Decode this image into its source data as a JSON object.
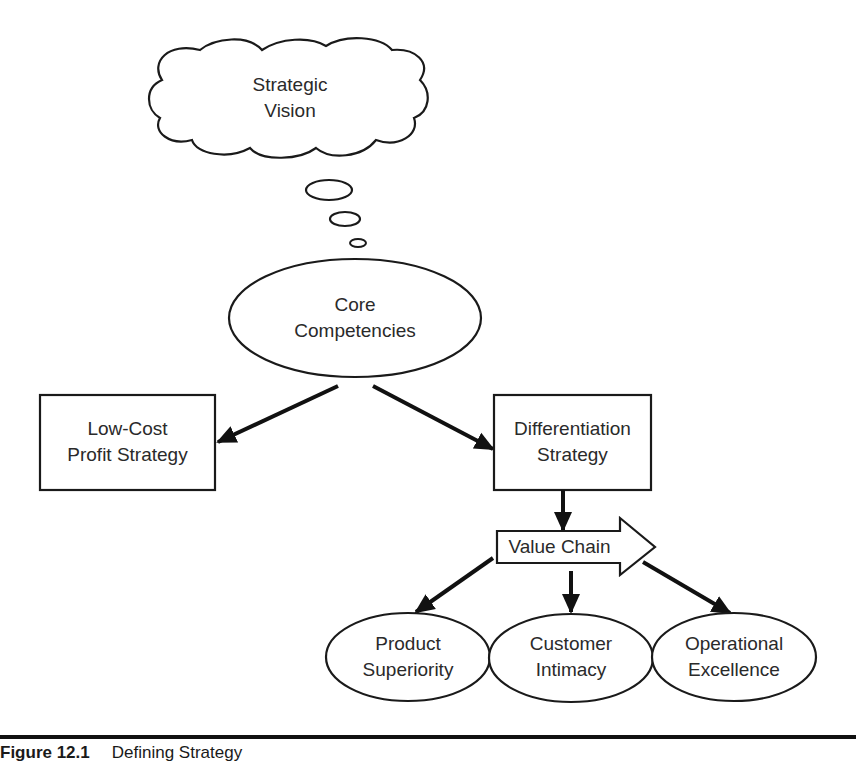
{
  "diagram": {
    "nodes": {
      "strategic_vision": {
        "shape": "cloud",
        "lines": [
          "Strategic",
          "Vision"
        ]
      },
      "core_competencies": {
        "shape": "ellipse",
        "lines": [
          "Core",
          "Competencies"
        ]
      },
      "low_cost": {
        "shape": "rectangle",
        "lines": [
          "Low-Cost",
          "Profit Strategy"
        ]
      },
      "differentiation": {
        "shape": "rectangle",
        "lines": [
          "Differentiation",
          "Strategy"
        ]
      },
      "value_chain": {
        "shape": "block-arrow",
        "lines": [
          "Value Chain"
        ]
      },
      "product_superiority": {
        "shape": "ellipse",
        "lines": [
          "Product",
          "Superiority"
        ]
      },
      "customer_intimacy": {
        "shape": "ellipse",
        "lines": [
          "Customer",
          "Intimacy"
        ]
      },
      "operational_excellence": {
        "shape": "ellipse",
        "lines": [
          "Operational",
          "Excellence"
        ]
      }
    },
    "edges": [
      {
        "from": "strategic_vision",
        "to": "core_competencies",
        "style": "thought-bubbles"
      },
      {
        "from": "core_competencies",
        "to": "low_cost",
        "style": "arrow"
      },
      {
        "from": "core_competencies",
        "to": "differentiation",
        "style": "arrow"
      },
      {
        "from": "differentiation",
        "to": "value_chain",
        "style": "arrow"
      },
      {
        "from": "value_chain",
        "to": "product_superiority",
        "style": "arrow"
      },
      {
        "from": "value_chain",
        "to": "customer_intimacy",
        "style": "arrow"
      },
      {
        "from": "value_chain",
        "to": "operational_excellence",
        "style": "arrow"
      }
    ],
    "colors": {
      "stroke": "#1a1a1a",
      "fill": "#ffffff",
      "text": "#2a2a2a"
    }
  },
  "caption": {
    "figure_number": "Figure 12.1",
    "title": "Defining Strategy"
  }
}
